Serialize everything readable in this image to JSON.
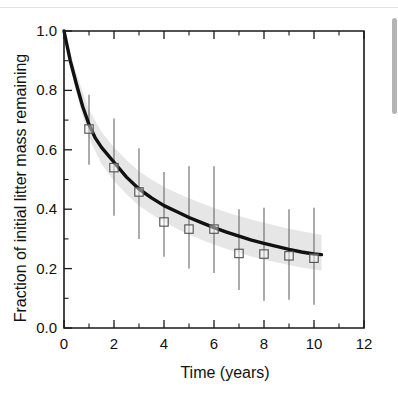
{
  "figure": {
    "background_color": "#ffffff",
    "frame_color": "#1a1a1a",
    "band_color": "#e6e6e6",
    "line_color": "#111111",
    "marker_edge_color": "#555555",
    "errorbar_color": "#6e6e6e"
  },
  "chart_data": {
    "type": "scatter",
    "title": "",
    "subtitle": "",
    "xlabel": "Time (years)",
    "ylabel": "Fraction of initial litter mass remaining",
    "xlim": [
      0,
      12
    ],
    "ylim": [
      0.0,
      1.0
    ],
    "grid": false,
    "legend": null,
    "xticks": [
      0,
      2,
      4,
      6,
      8,
      10,
      12
    ],
    "xticklabels": [
      "0",
      "2",
      "4",
      "6",
      "8",
      "10",
      "12"
    ],
    "xminorticks": [
      1,
      3,
      5,
      7,
      9,
      11
    ],
    "yticks": [
      0.0,
      0.2,
      0.4,
      0.6,
      0.8,
      1.0
    ],
    "yticklabels": [
      "0.0",
      "0.2",
      "0.4",
      "0.6",
      "0.8",
      "1.0"
    ],
    "yminorticks": [
      0.1,
      0.3,
      0.5,
      0.7,
      0.9
    ],
    "series": [
      {
        "name": "Observed mass remaining",
        "type": "scatter",
        "marker": "open-square",
        "x": [
          1,
          2,
          3,
          4,
          5,
          6,
          7,
          8,
          9,
          10
        ],
        "values": [
          0.67,
          0.54,
          0.458,
          0.357,
          0.333,
          0.333,
          0.251,
          0.249,
          0.243,
          0.235
        ],
        "error_low": [
          0.55,
          0.378,
          0.3,
          0.24,
          0.2,
          0.185,
          0.128,
          0.092,
          0.095,
          0.078
        ],
        "error_high": [
          0.785,
          0.705,
          0.605,
          0.525,
          0.545,
          0.545,
          0.4,
          0.405,
          0.4,
          0.405
        ]
      },
      {
        "name": "Fitted decay model",
        "type": "line",
        "x": [
          0,
          0.25,
          0.5,
          0.75,
          1,
          1.25,
          1.5,
          2,
          2.5,
          3,
          3.5,
          4,
          4.5,
          5,
          5.5,
          6,
          6.5,
          7,
          7.5,
          8,
          8.5,
          9,
          9.5,
          10,
          10.3
        ],
        "values": [
          1.0,
          0.9,
          0.82,
          0.745,
          0.685,
          0.64,
          0.608,
          0.558,
          0.508,
          0.468,
          0.438,
          0.412,
          0.392,
          0.372,
          0.355,
          0.338,
          0.323,
          0.309,
          0.296,
          0.285,
          0.275,
          0.265,
          0.256,
          0.249,
          0.247
        ]
      },
      {
        "name": "Confidence band upper",
        "type": "band-edge",
        "x": [
          0,
          0.5,
          1,
          1.5,
          2,
          2.5,
          3,
          3.5,
          4,
          4.5,
          5,
          5.5,
          6,
          6.5,
          7,
          7.5,
          8,
          8.5,
          9,
          9.5,
          10,
          10.3
        ],
        "values": [
          1.0,
          0.855,
          0.735,
          0.66,
          0.608,
          0.565,
          0.528,
          0.5,
          0.475,
          0.455,
          0.437,
          0.42,
          0.404,
          0.39,
          0.377,
          0.365,
          0.354,
          0.344,
          0.334,
          0.326,
          0.318,
          0.314
        ]
      },
      {
        "name": "Confidence band lower",
        "type": "band-edge",
        "x": [
          0,
          0.5,
          1,
          1.5,
          2,
          2.5,
          3,
          3.5,
          4,
          4.5,
          5,
          5.5,
          6,
          6.5,
          7,
          7.5,
          8,
          8.5,
          9,
          9.5,
          10,
          10.3
        ],
        "values": [
          1.0,
          0.79,
          0.638,
          0.553,
          0.495,
          0.45,
          0.412,
          0.383,
          0.357,
          0.335,
          0.315,
          0.297,
          0.281,
          0.266,
          0.253,
          0.241,
          0.23,
          0.221,
          0.212,
          0.204,
          0.197,
          0.194
        ]
      }
    ]
  }
}
